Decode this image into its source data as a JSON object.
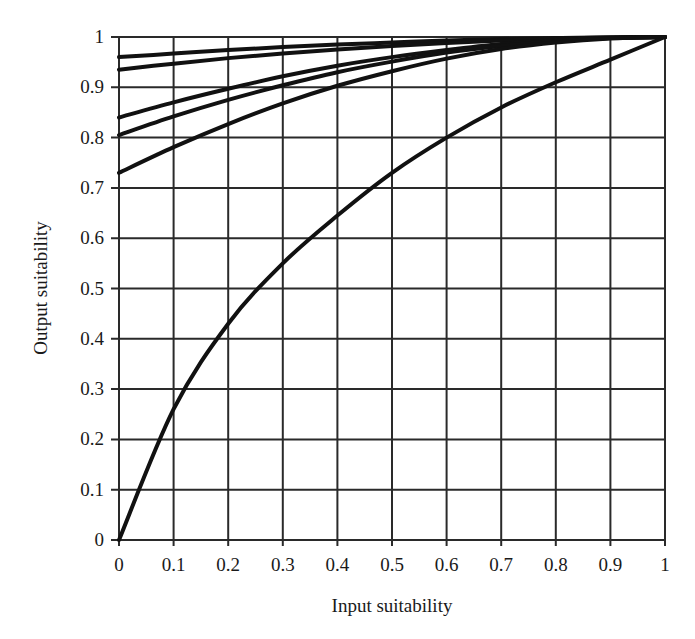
{
  "chart_data": {
    "type": "line",
    "title": "",
    "xlabel": "Input suitability",
    "ylabel": "Output suitability",
    "xlim": [
      0,
      1
    ],
    "ylim": [
      0,
      1
    ],
    "grid": true,
    "legend": "none",
    "x_ticks": [
      "0",
      "0.1",
      "0.2",
      "0.3",
      "0.4",
      "0.5",
      "0.6",
      "0.7",
      "0.8",
      "0.9",
      "1"
    ],
    "y_ticks": [
      "0",
      "0.1",
      "0.2",
      "0.3",
      "0.4",
      "0.5",
      "0.6",
      "0.7",
      "0.8",
      "0.9",
      "1"
    ],
    "x": [
      0,
      0.1,
      0.2,
      0.3,
      0.4,
      0.5,
      0.6,
      0.7,
      0.8,
      0.9,
      1.0
    ],
    "series": [
      {
        "name": "curve-1",
        "values": [
          0.96,
          0.967,
          0.974,
          0.98,
          0.985,
          0.989,
          0.993,
          0.996,
          0.998,
          0.9996,
          1.0
        ]
      },
      {
        "name": "curve-2",
        "values": [
          0.935,
          0.947,
          0.958,
          0.967,
          0.975,
          0.982,
          0.988,
          0.993,
          0.997,
          0.999,
          1.0
        ]
      },
      {
        "name": "curve-3",
        "values": [
          0.84,
          0.87,
          0.897,
          0.922,
          0.943,
          0.96,
          0.974,
          0.986,
          0.994,
          0.998,
          1.0
        ]
      },
      {
        "name": "curve-4",
        "values": [
          0.805,
          0.842,
          0.875,
          0.904,
          0.93,
          0.951,
          0.969,
          0.982,
          0.992,
          0.998,
          1.0
        ]
      },
      {
        "name": "curve-5",
        "values": [
          0.73,
          0.781,
          0.827,
          0.868,
          0.903,
          0.932,
          0.957,
          0.976,
          0.989,
          0.997,
          1.0
        ]
      },
      {
        "name": "curve-6",
        "values": [
          0.0,
          0.26,
          0.43,
          0.55,
          0.645,
          0.73,
          0.8,
          0.86,
          0.91,
          0.955,
          1.0
        ]
      }
    ]
  }
}
